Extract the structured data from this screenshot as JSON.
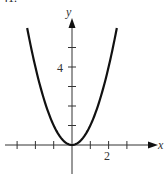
{
  "problem_number": "41.",
  "chart_data": {
    "type": "line",
    "title": "",
    "function": "y = x^2",
    "xlabel": "x",
    "ylabel": "y",
    "xlim": [
      -3.1,
      4.3
    ],
    "ylim": [
      -1.5,
      6.4
    ],
    "x_ticks": [
      -3,
      -2,
      -1,
      1,
      2,
      3
    ],
    "x_tick_labels": [
      {
        "value": 2,
        "label": "2"
      }
    ],
    "y_ticks": [
      1,
      2,
      3,
      4,
      5
    ],
    "y_tick_labels": [
      {
        "value": 4,
        "label": "4"
      }
    ],
    "grid": false,
    "series": [
      {
        "name": "parabola",
        "x": [
          -2.45,
          -2,
          -1.5,
          -1,
          -0.5,
          0,
          0.5,
          1,
          1.5,
          2,
          2.45
        ],
        "values": [
          6.0,
          4,
          2.25,
          1,
          0.25,
          0,
          0.25,
          1,
          2.25,
          4,
          6.0
        ]
      }
    ]
  },
  "labels": {
    "x_axis": "x",
    "y_axis": "y",
    "x_tick_2": "2",
    "y_tick_4": "4"
  }
}
